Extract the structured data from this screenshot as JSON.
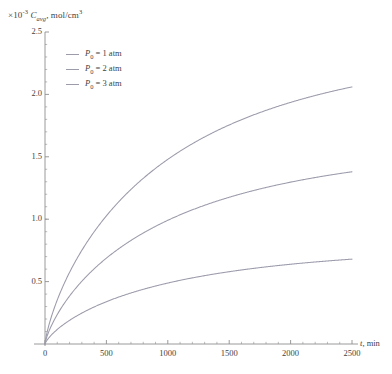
{
  "chart_data": {
    "type": "line",
    "title": "",
    "ylabel_prefix": "×10",
    "ylabel_exponent": "-3",
    "ylabel_symbol": "C",
    "ylabel_subscript": "avg",
    "ylabel_units": ", mol/cm",
    "ylabel_units_exponent": "3",
    "ylabel": "×10⁻³ C_avg, mol/cm³",
    "xlabel": "t, min",
    "xlabel_symbol": "t",
    "xlabel_units": ", min",
    "xlim": [
      0,
      2600
    ],
    "ylim": [
      0,
      2.5
    ],
    "xticks": [
      0,
      500,
      1000,
      1500,
      2000,
      2500
    ],
    "xtick_labels": [
      "0",
      "500",
      "1000",
      "1500",
      "2000",
      "2500"
    ],
    "yticks": [
      0.5,
      1.0,
      1.5,
      2.0,
      2.5
    ],
    "ytick_labels": [
      "0.5",
      "1.0",
      "1.5",
      "2.0",
      "2.5"
    ],
    "grid": false,
    "legend_position": "upper-left-inside",
    "x": [
      0,
      25,
      50,
      75,
      100,
      150,
      200,
      250,
      300,
      400,
      500,
      600,
      700,
      800,
      900,
      1000,
      1100,
      1200,
      1300,
      1400,
      1500,
      1600,
      1700,
      1800,
      1900,
      2000,
      2100,
      2200,
      2300,
      2400,
      2500
    ],
    "series": [
      {
        "name": "P₀ = 1 atm",
        "label_symbol": "P",
        "label_subscript": "0",
        "label_rest": " = 1 atm",
        "color": "#9b9bab",
        "plateau": 0.97,
        "rate": 0.00095,
        "endpoint": 0.68,
        "values": [
          0,
          0.023,
          0.045,
          0.067,
          0.088,
          0.129,
          0.167,
          0.203,
          0.237,
          0.299,
          0.354,
          0.403,
          0.446,
          0.484,
          0.518,
          0.548,
          0.574,
          0.598,
          0.619,
          0.637,
          0.653,
          0.668,
          0.681,
          0.692,
          0.702,
          0.711,
          0.719,
          0.726,
          0.732,
          0.738,
          0.743
        ]
      },
      {
        "name": "P₀ = 2 atm",
        "label_symbol": "P",
        "label_subscript": "0",
        "label_rest": " = 2 atm",
        "color": "#9b9bab",
        "plateau": 1.94,
        "rate": 0.00095,
        "endpoint": 1.38,
        "values": [
          0,
          0.046,
          0.091,
          0.135,
          0.176,
          0.257,
          0.333,
          0.405,
          0.473,
          0.598,
          0.707,
          0.805,
          0.891,
          0.967,
          1.035,
          1.095,
          1.148,
          1.195,
          1.237,
          1.275,
          1.307,
          1.337,
          1.362,
          1.385,
          1.405,
          1.423,
          1.438,
          1.452,
          1.465,
          1.476,
          1.486
        ]
      },
      {
        "name": "P₀ = 3 atm",
        "label_symbol": "P",
        "label_subscript": "0",
        "label_rest": " = 3 atm",
        "color": "#9b9bab",
        "plateau": 2.9,
        "rate": 0.00095,
        "endpoint": 2.06,
        "values": [
          0,
          0.068,
          0.136,
          0.201,
          0.264,
          0.384,
          0.497,
          0.605,
          0.707,
          0.894,
          1.057,
          1.203,
          1.331,
          1.445,
          1.546,
          1.636,
          1.715,
          1.786,
          1.849,
          1.905,
          1.954,
          1.998,
          2.036,
          2.07,
          2.1,
          2.126,
          2.15,
          2.17,
          2.188,
          2.205,
          2.22
        ]
      }
    ]
  },
  "axis": {
    "y_axis_color": "#8f8f8f",
    "x_axis_color": "#8f8f8f"
  }
}
